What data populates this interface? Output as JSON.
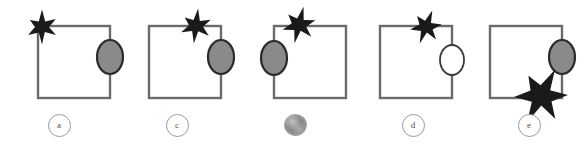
{
  "figure": {
    "background_color": "#ffffff",
    "panel_count": 5,
    "square": {
      "stroke_color": "#6b6b6b",
      "fill_color": "#ffffff",
      "stroke_width": 2.4,
      "size_px": 72
    },
    "ellipse": {
      "filled_color": "#8a8a8a",
      "filled_stroke": "#2b2b2b",
      "empty_color": "#ffffff",
      "empty_stroke": "#3a3a3a",
      "rx": 13,
      "ry": 17
    },
    "star": {
      "color": "#1a1a1a",
      "points": 6,
      "normal_radius": 16,
      "large_radius": 28
    },
    "label_circle": {
      "stroke_color": "#9a9a9a",
      "text_color": "#4a4a4a"
    }
  },
  "panels": [
    {
      "id": "panel-a",
      "label": "a",
      "label_type": "letter",
      "label_legible": true,
      "square": {
        "x": 38,
        "y": 26,
        "size": 72
      },
      "star": {
        "cx": 42,
        "cy": 27,
        "radius": 16,
        "position": "top-left-corner"
      },
      "ellipse": {
        "cx": 110,
        "cy": 57,
        "rx": 13,
        "ry": 17,
        "fill": "gray",
        "position": "right-edge"
      }
    },
    {
      "id": "panel-c",
      "label": "c",
      "label_type": "letter",
      "label_legible": true,
      "square": {
        "x": 31,
        "y": 26,
        "size": 72
      },
      "star": {
        "cx": 78,
        "cy": 26,
        "radius": 16,
        "position": "top-edge-right"
      },
      "ellipse": {
        "cx": 103,
        "cy": 57,
        "rx": 13,
        "ry": 17,
        "fill": "gray",
        "position": "right-edge"
      }
    },
    {
      "id": "panel-b-smudged",
      "label": "",
      "label_type": "smudge",
      "label_legible": false,
      "square": {
        "x": 38,
        "y": 26,
        "size": 72
      },
      "star": {
        "cx": 63,
        "cy": 25,
        "radius": 17,
        "position": "top-edge-left"
      },
      "ellipse": {
        "cx": 38,
        "cy": 58,
        "rx": 13,
        "ry": 17,
        "fill": "gray",
        "position": "left-edge"
      }
    },
    {
      "id": "panel-d",
      "label": "d",
      "label_type": "letter",
      "label_legible": true,
      "square": {
        "x": 26,
        "y": 26,
        "size": 72
      },
      "star": {
        "cx": 72,
        "cy": 27,
        "radius": 16,
        "position": "top-edge-right"
      },
      "ellipse": {
        "cx": 98,
        "cy": 60,
        "rx": 12,
        "ry": 15,
        "fill": "white",
        "position": "right-edge"
      }
    },
    {
      "id": "panel-e",
      "label": "e",
      "label_type": "letter",
      "label_legible": true,
      "square": {
        "x": 20,
        "y": 26,
        "size": 72
      },
      "star": {
        "cx": 71,
        "cy": 96,
        "radius": 27,
        "position": "bottom-edge-right"
      },
      "ellipse": {
        "cx": 92,
        "cy": 57,
        "rx": 13,
        "ry": 17,
        "fill": "gray",
        "position": "right-edge"
      }
    }
  ],
  "panel_offsets": [
    0,
    118,
    236,
    354,
    470
  ]
}
